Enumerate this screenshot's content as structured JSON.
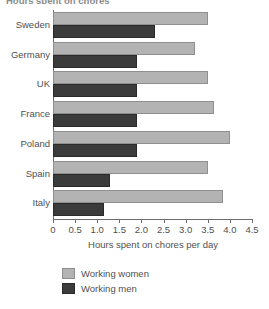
{
  "clipped_header_text": "Hours spent on chores",
  "chart_data": {
    "type": "bar",
    "orientation": "horizontal",
    "title": "",
    "xlabel": "Hours spent on chores per day",
    "ylabel": "",
    "xlim": [
      0,
      4.5
    ],
    "xticks": [
      "0",
      "0.5",
      "1.0",
      "1.5",
      "2.0",
      "2.5",
      "3.0",
      "3.5",
      "4.0",
      "4.5"
    ],
    "xtick_values": [
      0,
      0.5,
      1.0,
      1.5,
      2.0,
      2.5,
      3.0,
      3.5,
      4.0,
      4.5
    ],
    "grid": false,
    "legend_position": "bottom-left",
    "categories": [
      "Sweden",
      "Germany",
      "UK",
      "France",
      "Poland",
      "Spain",
      "Italy"
    ],
    "series": [
      {
        "name": "Working women",
        "color": "#b3b3b3",
        "values": [
          3.5,
          3.2,
          3.5,
          3.65,
          4.0,
          3.5,
          3.85
        ]
      },
      {
        "name": "Working men",
        "color": "#3b3b3b",
        "values": [
          2.3,
          1.9,
          1.9,
          1.9,
          1.9,
          1.3,
          1.15
        ]
      }
    ]
  }
}
